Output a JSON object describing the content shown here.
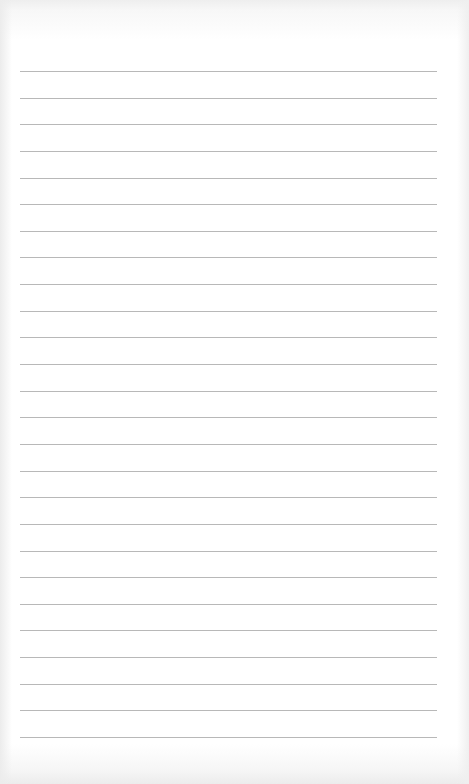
{
  "page": {
    "type": "blank-lined-paper",
    "background_color": "#ffffff",
    "rule_color": "#b8b8b8",
    "rule_count": 26,
    "first_rule_y": 71,
    "rule_spacing": 26.64,
    "rule_left": 20,
    "rule_width": 417
  }
}
